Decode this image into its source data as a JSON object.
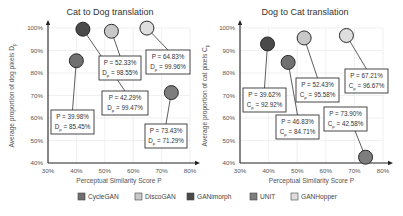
{
  "chart_data": [
    {
      "type": "scatter",
      "title": "Cat to Dog translation",
      "xlabel": "Perceptual Similarity Score P",
      "ylabel": "Average proportion of dog pixels D",
      "ylabel_subscript": "p",
      "xlim": [
        30,
        80
      ],
      "ylim": [
        40,
        100
      ],
      "xticks": [
        "30%",
        "40%",
        "50%",
        "60%",
        "70%",
        "80%"
      ],
      "yticks": [
        "40%",
        "50%",
        "60%",
        "70%",
        "80%",
        "90%",
        "100%"
      ],
      "grid": true,
      "metric_symbol": "D",
      "metric_subscript": "p",
      "points": [
        {
          "series": "CycleGAN",
          "x": 39.98,
          "y": 85.45,
          "label_p": "P = 39.98%",
          "label_m": " = 85.45%"
        },
        {
          "series": "GANimorph",
          "x": 42.29,
          "y": 99.47,
          "label_p": "P = 42.29%",
          "label_m": " =  99.47%"
        },
        {
          "series": "DiscoGAN",
          "x": 52.33,
          "y": 98.55,
          "label_p": "P = 52.33%",
          "label_m": " = 98.55%"
        },
        {
          "series": "GANHopper",
          "x": 64.83,
          "y": 99.96,
          "label_p": "P = 64.83%",
          "label_m": " = 99.96%"
        },
        {
          "series": "UNIT",
          "x": 73.43,
          "y": 71.29,
          "label_p": "P = 73.43%",
          "label_m": " = 71.29%"
        }
      ]
    },
    {
      "type": "scatter",
      "title": "Dog to Cat translation",
      "xlabel": "Perceptual Similarity Score P",
      "ylabel": "Average proportion of cat pixels C",
      "ylabel_subscript": "p",
      "xlim": [
        30,
        80
      ],
      "ylim": [
        40,
        100
      ],
      "xticks": [
        "30%",
        "40%",
        "50%",
        "60%",
        "70%",
        "80%"
      ],
      "yticks": [
        "40%",
        "50%",
        "60%",
        "70%",
        "80%",
        "90%",
        "100%"
      ],
      "grid": true,
      "metric_symbol": "C",
      "metric_subscript": "p",
      "points": [
        {
          "series": "GANimorph",
          "x": 39.62,
          "y": 92.92,
          "label_p": "P = 39.62%",
          "label_m": " = 92.92%"
        },
        {
          "series": "CycleGAN",
          "x": 46.83,
          "y": 84.71,
          "label_p": "P = 46.83%",
          "label_m": " = 84.71%"
        },
        {
          "series": "DiscoGAN",
          "x": 52.43,
          "y": 95.58,
          "label_p": "P = 52.43%",
          "label_m": " = 95.58%"
        },
        {
          "series": "GANHopper",
          "x": 67.21,
          "y": 96.67,
          "label_p": "P = 67.21%",
          "label_m": " =  96.67%"
        },
        {
          "series": "UNIT",
          "x": 73.9,
          "y": 42.58,
          "label_p": "P = 73.90%",
          "label_m": " = 42.58%"
        }
      ]
    }
  ],
  "legend": {
    "placement": "bottom",
    "entries": [
      {
        "name": "CycleGAN",
        "color": "#707070"
      },
      {
        "name": "DiscoGAN",
        "color": "#c8c8c8"
      },
      {
        "name": "GANimorph",
        "color": "#4a4a4a"
      },
      {
        "name": "UNIT",
        "color": "#7d7d7d"
      },
      {
        "name": "GANHopper",
        "color": "#dedede"
      }
    ]
  }
}
